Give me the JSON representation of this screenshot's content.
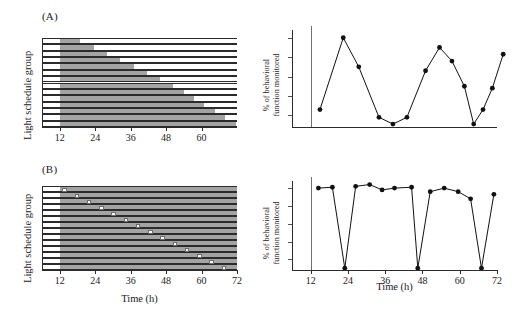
{
  "figure": {
    "panels": [
      {
        "id": "A",
        "label": "(A)",
        "actogram": {
          "ylabel": "Light schedule group",
          "xlabel": "",
          "xticks": [
            "12",
            "24",
            "36",
            "48",
            "60"
          ],
          "xtick_values": [
            12,
            24,
            36,
            48,
            60
          ],
          "xlim": [
            6,
            72
          ],
          "rows": 14,
          "bar_start": 12,
          "bar_ends": [
            19,
            23.5,
            28,
            32.5,
            37,
            41.5,
            46,
            50.5,
            54,
            57.5,
            61,
            64.5,
            68,
            71.5
          ]
        },
        "linechart": {
          "ylabel_line1": "% of behavioral",
          "ylabel_line2": "function monitored",
          "xlabel": "",
          "xticks": [],
          "ylim": [
            0,
            100
          ],
          "ytick_count": 5,
          "vline_at": 12
        }
      },
      {
        "id": "B",
        "label": "(B)",
        "actogram": {
          "ylabel": "Light schedule group",
          "xlabel": "Time (h)",
          "xticks": [
            "12",
            "24",
            "36",
            "48",
            "60",
            "72"
          ],
          "xtick_values": [
            12,
            24,
            36,
            48,
            60,
            72
          ],
          "xlim": [
            6,
            72
          ],
          "rows": 14,
          "bar_start": 12,
          "bar_end": 72,
          "square_positions": [
            13.6,
            17.8,
            21.9,
            26.1,
            30.2,
            34.4,
            38.5,
            42.7,
            46.8,
            51.0,
            55.1,
            59.3,
            63.4,
            67.6
          ]
        },
        "linechart": {
          "ylabel_line1": "% of behavioral",
          "ylabel_line2": "function monitored",
          "xlabel": "Time (h)",
          "xticks": [
            "12",
            "24",
            "36",
            "48",
            "60",
            "72"
          ],
          "xtick_values": [
            12,
            24,
            36,
            48,
            60,
            72
          ],
          "ylim": [
            0,
            100
          ],
          "ytick_count": 5,
          "vline_at": 12
        }
      }
    ]
  },
  "chart_data": [
    {
      "id": "panel-a-actogram",
      "type": "bar",
      "title": "(A) Light schedule raster",
      "xlabel": "Time (h)",
      "ylabel": "Light schedule group",
      "xlim": [
        6,
        72
      ],
      "categories": [
        "1",
        "2",
        "3",
        "4",
        "5",
        "6",
        "7",
        "8",
        "9",
        "10",
        "11",
        "12",
        "13",
        "14"
      ],
      "bar_start": 12,
      "values": [
        19,
        23.5,
        28,
        32.5,
        37,
        41.5,
        46,
        50.5,
        54,
        57.5,
        61,
        64.5,
        68,
        71.5
      ],
      "grid": false,
      "legend": "none",
      "note": "Each group's shaded light block begins at hour 12 and ends progressively later, creating a descending staircase."
    },
    {
      "id": "panel-a-line",
      "type": "line",
      "title": "(A) Behavioral function vs time",
      "xlabel": "Time (h)",
      "ylabel": "% of behavioral function monitored",
      "xlim": [
        6,
        72
      ],
      "ylim": [
        0,
        100
      ],
      "grid": false,
      "legend": "none",
      "marker": "filled-circle",
      "x": [
        15,
        22.5,
        27.5,
        34,
        38.5,
        43,
        49,
        53.5,
        57.5,
        61.5,
        64.5,
        67.5,
        70.5,
        74
      ],
      "values": [
        18,
        92,
        62,
        10,
        3,
        10,
        58,
        82,
        68,
        42,
        3,
        18,
        40,
        75
      ]
    },
    {
      "id": "panel-b-actogram",
      "type": "bar",
      "title": "(B) Light schedule raster with pulse",
      "xlabel": "Time (h)",
      "ylabel": "Light schedule group",
      "xlim": [
        6,
        72
      ],
      "categories": [
        "1",
        "2",
        "3",
        "4",
        "5",
        "6",
        "7",
        "8",
        "9",
        "10",
        "11",
        "12",
        "13",
        "14"
      ],
      "bar_start": 12,
      "bar_end": 72,
      "values": [
        13.6,
        17.8,
        21.9,
        26.1,
        30.2,
        34.4,
        38.5,
        42.7,
        46.8,
        51.0,
        55.1,
        59.3,
        63.4,
        67.6
      ],
      "grid": false,
      "legend": "none",
      "note": "All groups shaded from hour 12 to 72; a single white pulse marker steps later by about 4.2 h per group."
    },
    {
      "id": "panel-b-line",
      "type": "line",
      "title": "(B) Behavioral function vs time",
      "xlabel": "Time (h)",
      "ylabel": "% of behavioral function monitored",
      "xlim": [
        6,
        72
      ],
      "ylim": [
        0,
        100
      ],
      "grid": false,
      "legend": "none",
      "marker": "filled-circle",
      "x": [
        14.5,
        19,
        23,
        26.5,
        31,
        35,
        39,
        44.5,
        46.5,
        50.5,
        55,
        59.5,
        63.5,
        67,
        71
      ],
      "values": [
        92,
        93,
        2,
        94,
        96,
        90,
        92,
        93,
        2,
        88,
        92,
        88,
        80,
        2,
        85
      ]
    }
  ]
}
